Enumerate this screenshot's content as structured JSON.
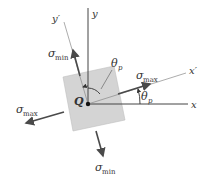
{
  "diagram": {
    "type": "principal-stress-element",
    "colors": {
      "axis": "#444444",
      "rotated_axis": "#777777",
      "arrow": "#4a4a4a",
      "element_fill": "#d4d4d4",
      "element_stroke": "#bbbbbb",
      "text": "#333333"
    },
    "axes": {
      "x": {
        "label": "x"
      },
      "y": {
        "label": "y"
      },
      "x_prime": {
        "label": "x′"
      },
      "y_prime": {
        "label": "y′"
      }
    },
    "origin": {
      "label": "Q"
    },
    "angles": [
      {
        "symbol": "θ",
        "subscript": "p",
        "location": "between y and y'"
      },
      {
        "symbol": "θ",
        "subscript": "p",
        "location": "between x and x'"
      }
    ],
    "stresses": [
      {
        "symbol": "σ",
        "subscript": "max",
        "direction": "+x'"
      },
      {
        "symbol": "σ",
        "subscript": "max",
        "direction": "-x'"
      },
      {
        "symbol": "σ",
        "subscript": "min",
        "direction": "+y'"
      },
      {
        "symbol": "σ",
        "subscript": "min",
        "direction": "-y'"
      }
    ]
  }
}
